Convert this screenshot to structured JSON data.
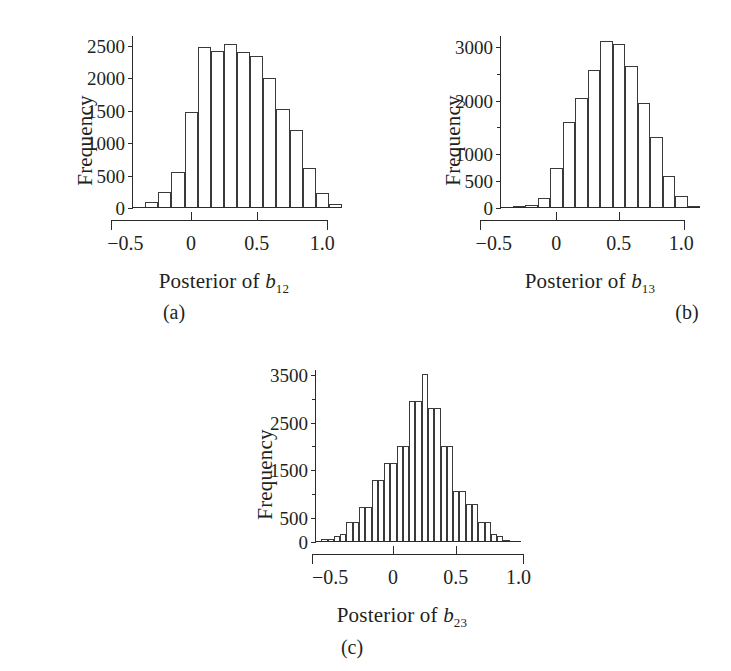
{
  "figure": {
    "background": "#ffffff",
    "ink": "#231f20",
    "panels": [
      {
        "id": "a",
        "caption": "(a)",
        "ylabel": "Frequency",
        "xlabel_prefix": "Posterior of ",
        "xlabel_symbol": "b",
        "xlabel_subscript": "12"
      },
      {
        "id": "b",
        "caption": "(b)",
        "ylabel": "Frequency",
        "xlabel_prefix": "Posterior of ",
        "xlabel_symbol": "b",
        "xlabel_subscript": "13"
      },
      {
        "id": "c",
        "caption": "(c)",
        "ylabel": "Frequency",
        "xlabel_prefix": "Posterior of ",
        "xlabel_symbol": "b",
        "xlabel_subscript": "23"
      }
    ]
  },
  "chart_data": [
    {
      "type": "bar",
      "panel": "a",
      "title": "",
      "xlabel": "Posterior of b12",
      "ylabel": "Frequency",
      "xlim": [
        -0.45,
        1.15
      ],
      "ylim": [
        0,
        2650
      ],
      "grid": false,
      "legend": null,
      "bin_width": 0.1,
      "xticks": [
        -0.5,
        0,
        0.5,
        1.0
      ],
      "xtick_labels": [
        "−0.5",
        "0",
        "0.5",
        "1.0"
      ],
      "yticks": [
        0,
        500,
        1000,
        1500,
        2000,
        2500
      ],
      "ytick_labels": [
        "0",
        "500",
        "1000",
        "1500",
        "2000",
        "2500"
      ],
      "ytick_minor": [],
      "bin_starts": [
        -0.45,
        -0.35,
        -0.25,
        -0.15,
        -0.05,
        0.05,
        0.15,
        0.25,
        0.35,
        0.45,
        0.55,
        0.65,
        0.75,
        0.85,
        0.95,
        1.05
      ],
      "categories": [
        "-0.45",
        "-0.35",
        "-0.25",
        "-0.15",
        "-0.05",
        "0.05",
        "0.15",
        "0.25",
        "0.35",
        "0.45",
        "0.55",
        "0.65",
        "0.75",
        "0.85",
        "0.95",
        "1.05"
      ],
      "values": [
        20,
        90,
        250,
        560,
        1480,
        2480,
        2420,
        2520,
        2400,
        2340,
        2000,
        1520,
        1200,
        620,
        230,
        55
      ]
    },
    {
      "type": "bar",
      "panel": "b",
      "title": "",
      "xlabel": "Posterior of b13",
      "ylabel": "Frequency",
      "xlim": [
        -0.45,
        1.15
      ],
      "ylim": [
        0,
        3200
      ],
      "grid": false,
      "legend": null,
      "bin_width": 0.1,
      "xticks": [
        -0.5,
        0,
        0.5,
        1.0
      ],
      "xtick_labels": [
        "−0.5",
        "0",
        "0.5",
        "1.0"
      ],
      "yticks": [
        0,
        500,
        1000,
        1500,
        2000,
        2500,
        3000
      ],
      "ytick_labels": [
        "0",
        "500",
        "1000",
        "",
        "2000",
        "",
        "3000"
      ],
      "ytick_minor": [
        1500,
        2500
      ],
      "bin_starts": [
        -0.45,
        -0.35,
        -0.25,
        -0.15,
        -0.05,
        0.05,
        0.15,
        0.25,
        0.35,
        0.45,
        0.55,
        0.65,
        0.75,
        0.85,
        0.95,
        1.05
      ],
      "categories": [
        "-0.45",
        "-0.35",
        "-0.25",
        "-0.15",
        "-0.05",
        "0.05",
        "0.15",
        "0.25",
        "0.35",
        "0.45",
        "0.55",
        "0.65",
        "0.75",
        "0.85",
        "0.95",
        "1.05"
      ],
      "values": [
        15,
        40,
        60,
        190,
        740,
        1600,
        2050,
        2570,
        3110,
        3050,
        2650,
        1960,
        1330,
        590,
        230,
        40
      ]
    },
    {
      "type": "bar",
      "panel": "c",
      "title": "",
      "xlabel": "Posterior of b23",
      "ylabel": "Frequency",
      "xlim": [
        -0.62,
        1.02
      ],
      "ylim": [
        0,
        3600
      ],
      "grid": false,
      "legend": null,
      "bin_width": 0.05,
      "xticks": [
        -0.5,
        0,
        0.5,
        1.0
      ],
      "xtick_labels": [
        "−0.5",
        "0",
        "0.5",
        "1.0"
      ],
      "yticks": [
        0,
        500,
        1000,
        1500,
        2000,
        2500,
        3000,
        3500
      ],
      "ytick_labels": [
        "0",
        "500",
        "",
        "1500",
        "",
        "2500",
        "",
        "3500"
      ],
      "ytick_minor": [
        1000,
        2000,
        3000
      ],
      "bin_starts": [
        -0.62,
        -0.57,
        -0.52,
        -0.47,
        -0.42,
        -0.37,
        -0.32,
        -0.27,
        -0.22,
        -0.17,
        -0.12,
        -0.07,
        -0.02,
        0.03,
        0.08,
        0.13,
        0.18,
        0.23,
        0.28,
        0.33,
        0.38,
        0.43,
        0.48,
        0.53,
        0.58,
        0.63,
        0.68,
        0.73,
        0.78,
        0.83,
        0.88,
        0.93
      ],
      "categories": [
        "-0.62",
        "-0.57",
        "-0.52",
        "-0.47",
        "-0.42",
        "-0.37",
        "-0.32",
        "-0.27",
        "-0.22",
        "-0.17",
        "-0.12",
        "-0.07",
        "-0.02",
        "0.03",
        "0.08",
        "0.13",
        "0.18",
        "0.23",
        "0.28",
        "0.33",
        "0.38",
        "0.43",
        "0.48",
        "0.53",
        "0.58",
        "0.63",
        "0.68",
        "0.73",
        "0.78",
        "0.83",
        "0.88",
        "0.93"
      ],
      "values": [
        30,
        60,
        60,
        130,
        170,
        420,
        420,
        740,
        740,
        1300,
        1300,
        1650,
        1650,
        2000,
        2000,
        2950,
        2950,
        3510,
        2800,
        2800,
        2000,
        2000,
        1070,
        1070,
        800,
        800,
        420,
        420,
        160,
        130,
        50,
        20
      ]
    }
  ]
}
